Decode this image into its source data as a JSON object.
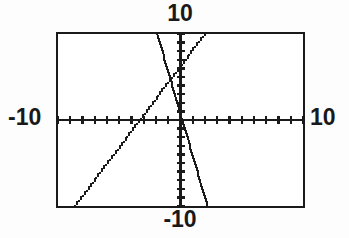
{
  "screen": {
    "kind": "graphing-calculator-viewport",
    "background_color": "#ffffff",
    "ink_color": "#1a1a1a"
  },
  "labels": {
    "y_max": "10",
    "y_min": "-10",
    "x_min": "-10",
    "x_max": "10"
  },
  "chart_data": {
    "type": "line",
    "title": "",
    "xlabel": "",
    "ylabel": "",
    "xlim": [
      -10,
      10
    ],
    "ylim": [
      -10,
      10
    ],
    "grid": false,
    "legend": "none",
    "axes": {
      "x_axis_at_y": 0,
      "y_axis_at_x": 0,
      "x_tick_interval": 1,
      "y_tick_interval": 1,
      "x_tick_labels": [
        "-10",
        "10"
      ],
      "y_tick_labels": [
        "-10",
        "10"
      ],
      "tick_style": "hash-marks-on-axis"
    },
    "series": [
      {
        "name": "line-ascending",
        "style": "pixelated-solid",
        "color": "#1a1a1a",
        "slope": 1.05,
        "intercept": 2.95,
        "x_intercept": -2.8,
        "y_intercept": 2.95,
        "points": [
          [
            -8.6,
            -10.0
          ],
          [
            -2.8,
            0.0
          ],
          [
            0.0,
            2.95
          ],
          [
            2.0,
            10.0
          ]
        ]
      },
      {
        "name": "line-descending",
        "style": "pixelated-solid",
        "color": "#1a1a1a",
        "slope": -5.2,
        "intercept": 1.6,
        "x_intercept": 0.31,
        "y_intercept": 1.6,
        "points": [
          [
            -1.9,
            10.0
          ],
          [
            0.31,
            0.0
          ],
          [
            0.0,
            1.6
          ],
          [
            2.2,
            -10.0
          ]
        ]
      }
    ],
    "intersection": {
      "x": -1.3,
      "y": 2.7,
      "label": ""
    }
  }
}
